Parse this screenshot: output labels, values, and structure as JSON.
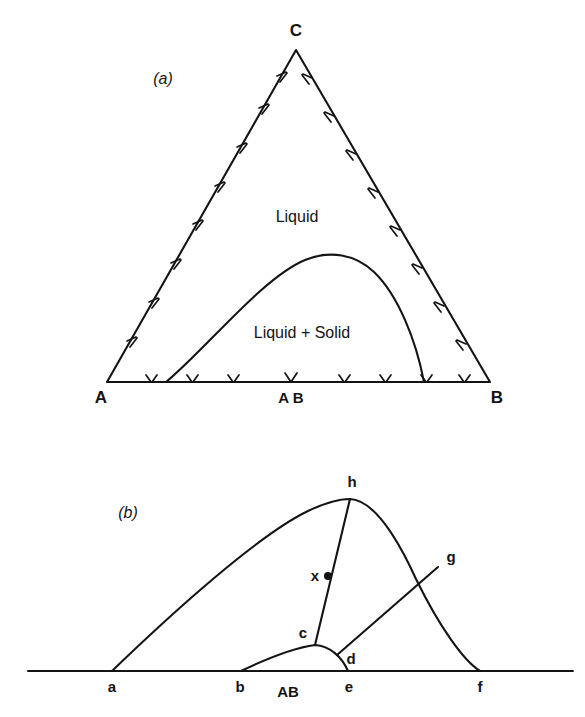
{
  "figure": {
    "panels": [
      {
        "id": "a",
        "tag": "(a)",
        "name": "ternary-phase-diagram",
        "vertices": [
          {
            "key": "left",
            "label": "A"
          },
          {
            "key": "right",
            "label": "B"
          },
          {
            "key": "apex",
            "label": "C"
          }
        ],
        "base_compound": {
          "label": "A B"
        },
        "regions": [
          {
            "key": "liquid",
            "label": "Liquid"
          },
          {
            "key": "two_phase",
            "label": "Liquid + Solid"
          }
        ],
        "edge_hatch_count_left": 8,
        "edge_hatch_count_right": 8,
        "edge_hatch_count_base": 8
      },
      {
        "id": "b",
        "tag": "(b)",
        "name": "liquidus-detail-diagram",
        "baseline_points": [
          {
            "key": "a",
            "label": "a"
          },
          {
            "key": "b",
            "label": "b"
          },
          {
            "key": "e",
            "label": "e"
          },
          {
            "key": "f",
            "label": "f"
          }
        ],
        "curve_points": [
          {
            "key": "c",
            "label": "c"
          },
          {
            "key": "d",
            "label": "d"
          },
          {
            "key": "g",
            "label": "g"
          },
          {
            "key": "h",
            "label": "h"
          }
        ],
        "marked_point": {
          "key": "x",
          "label": "x"
        },
        "base_compound": {
          "label": "AB"
        }
      }
    ],
    "colors": {
      "ink": "#141414",
      "background": "#ffffff"
    }
  }
}
